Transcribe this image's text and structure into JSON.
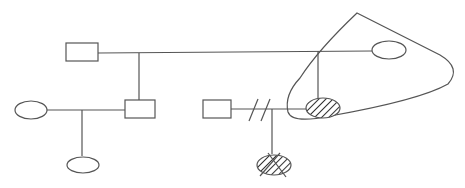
{
  "diagram": {
    "type": "pedigree",
    "stroke_color": "#555555",
    "fill_color": "#ffffff",
    "hatch_color": "#333333",
    "individuals": [
      {
        "id": "A",
        "shape": "square",
        "affected": false,
        "deceased": false
      },
      {
        "id": "B",
        "shape": "circle",
        "affected": false,
        "deceased": false
      },
      {
        "id": "C",
        "shape": "square",
        "affected": false,
        "deceased": false
      },
      {
        "id": "D",
        "shape": "circle",
        "affected": false,
        "deceased": false
      },
      {
        "id": "E",
        "shape": "circle",
        "affected": false,
        "deceased": false
      },
      {
        "id": "F",
        "shape": "square",
        "affected": false,
        "deceased": false
      },
      {
        "id": "G",
        "shape": "circle",
        "affected": true,
        "deceased": true
      },
      {
        "id": "H",
        "shape": "circle",
        "affected": true,
        "deceased": false
      }
    ],
    "relationships": [
      {
        "partners": [
          "A",
          "B"
        ],
        "children": [
          "C",
          "H"
        ]
      },
      {
        "partners": [
          "D",
          "C"
        ],
        "children": [
          "E"
        ]
      },
      {
        "partners": [
          "F",
          "H"
        ],
        "separated": true,
        "children": [
          "G"
        ]
      }
    ],
    "highlight_loop": {
      "encloses": [
        "B",
        "H"
      ]
    }
  }
}
